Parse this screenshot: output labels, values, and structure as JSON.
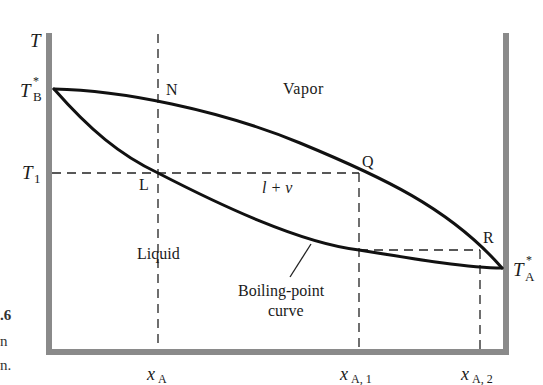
{
  "diagram": {
    "type": "temperature-composition phase diagram",
    "axes": {
      "y_label": "T",
      "x_ticks": [
        {
          "base": "x",
          "sub": "A"
        },
        {
          "base": "x",
          "sub": "A, 1"
        },
        {
          "base": "x",
          "sub": "A, 2"
        }
      ]
    },
    "left_axis_labels": {
      "tb_star": {
        "base": "T",
        "sup": "*",
        "sub": "B"
      },
      "t1": {
        "base": "T",
        "sub": "1"
      }
    },
    "right_axis_labels": {
      "ta_star": {
        "base": "T",
        "sup": "*",
        "sub": "A"
      }
    },
    "points": {
      "N": "N",
      "L": "L",
      "Q": "Q",
      "R": "R"
    },
    "regions": {
      "vapor": "Vapor",
      "two_phase": "l + v",
      "liquid": "Liquid"
    },
    "annotation": {
      "line1": "Boiling-point",
      "line2": "curve"
    },
    "colors": {
      "axis": "#8a8a8a",
      "curve": "#111111",
      "dashed": "#222222"
    }
  },
  "caption_fragments": {
    "line1": ".6",
    "line2": "n",
    "line3": "n."
  }
}
